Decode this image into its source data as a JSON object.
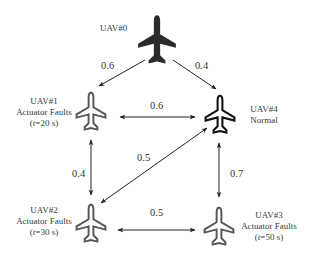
{
  "nodes": [
    {
      "id": "uav0",
      "name": "UAV#0",
      "status": "",
      "time_prefix": "",
      "time_var": "",
      "time_suffix": "",
      "style": "filled"
    },
    {
      "id": "uav1",
      "name": "UAV#1",
      "status": "Actuator Faults",
      "time_prefix": "(",
      "time_var": "t",
      "time_suffix": "=20 s)",
      "style": "gray-outline"
    },
    {
      "id": "uav2",
      "name": "UAV#2",
      "status": "Actuator Faults",
      "time_prefix": "(",
      "time_var": "t",
      "time_suffix": "=30 s)",
      "style": "gray-outline"
    },
    {
      "id": "uav3",
      "name": "UAV#3",
      "status": "Actuator Faults",
      "time_prefix": "(",
      "time_var": "t",
      "time_suffix": "=50 s)",
      "style": "gray-outline"
    },
    {
      "id": "uav4",
      "name": "UAV#4",
      "status": "Normal",
      "time_prefix": "",
      "time_var": "",
      "time_suffix": "",
      "style": "black-outline"
    }
  ],
  "edges": [
    {
      "from": "UAV#0",
      "to": "UAV#1",
      "weight": "0.6",
      "direction": "one-way"
    },
    {
      "from": "UAV#0",
      "to": "UAV#4",
      "weight": "0.4",
      "direction": "one-way"
    },
    {
      "from": "UAV#1",
      "to": "UAV#4",
      "weight": "0.6",
      "direction": "two-way"
    },
    {
      "from": "UAV#1",
      "to": "UAV#2",
      "weight": "0.4",
      "direction": "two-way"
    },
    {
      "from": "UAV#2",
      "to": "UAV#4",
      "weight": "0.5",
      "direction": "two-way"
    },
    {
      "from": "UAV#4",
      "to": "UAV#3",
      "weight": "0.7",
      "direction": "two-way"
    },
    {
      "from": "UAV#2",
      "to": "UAV#3",
      "weight": "0.5",
      "direction": "two-way"
    }
  ],
  "colors": {
    "leader": "#2b2b2b",
    "faulty_outline": "#555555",
    "normal_outline": "#111111",
    "arrow": "#222222"
  }
}
